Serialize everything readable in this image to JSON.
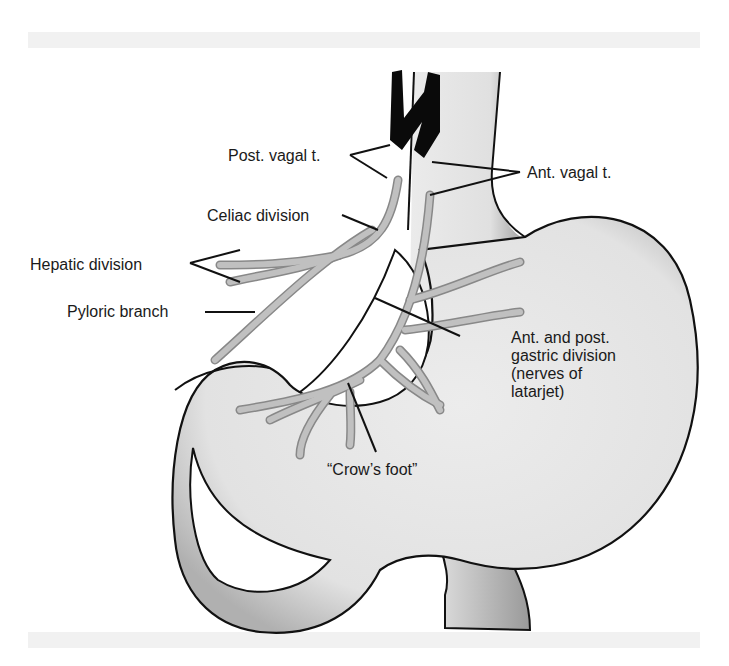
{
  "diagram": {
    "colors": {
      "stomach_fill": "#e8e8e8",
      "stomach_shade": "#b5b5b5",
      "outline": "#111111",
      "nerve_fill": "#b9b9b9",
      "trunk_fill": "#0a0a0a",
      "band": "#f1f1f1"
    },
    "labels": {
      "post_vagal": "Post. vagal t.",
      "ant_vagal": "Ant. vagal t.",
      "celiac": "Celiac division",
      "hepatic": "Hepatic division",
      "pyloric": "Pyloric branch",
      "gastric_line1": "Ant. and post.",
      "gastric_line2": "gastric division",
      "gastric_line3": "(nerves of",
      "gastric_line4": "latarjet)",
      "crows_foot": "“Crow’s foot”"
    }
  }
}
